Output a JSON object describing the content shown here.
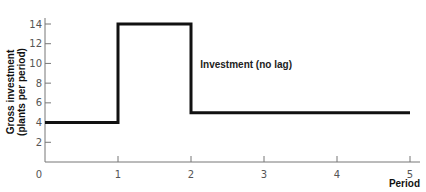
{
  "chart_data": {
    "type": "line",
    "title": "",
    "xlabel": "Period",
    "ylabel_lines": [
      "Gross investment",
      "(plants per period)"
    ],
    "ylabel": "Gross investment (plants per period)",
    "x_ticks": [
      "0",
      "1",
      "2",
      "3",
      "4",
      "5"
    ],
    "y_ticks": [
      "2",
      "4",
      "6",
      "8",
      "10",
      "12",
      "14"
    ],
    "xlim": [
      0,
      5
    ],
    "ylim": [
      0,
      14
    ],
    "grid": false,
    "legend": "none",
    "series": [
      {
        "name": "Investment (no lag)",
        "step": true,
        "x": [
          0,
          1,
          1,
          2,
          2,
          5
        ],
        "values": [
          4,
          4,
          14,
          14,
          5,
          5
        ]
      }
    ],
    "annotations": [
      {
        "text": "Investment (no lag)",
        "x": 2.1,
        "y": 9.5
      }
    ]
  }
}
